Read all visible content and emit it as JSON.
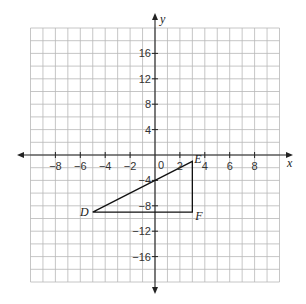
{
  "chart_data": {
    "type": "scatter",
    "title": "",
    "xlabel": "x",
    "ylabel": "y",
    "xlim": [
      -10,
      10
    ],
    "ylim": [
      -20,
      20
    ],
    "grid": true,
    "x_grid_step": 1,
    "y_grid_step": 2,
    "x_ticks": [
      -8,
      -6,
      -4,
      -2,
      2,
      4,
      6,
      8
    ],
    "y_ticks": [
      -16,
      -12,
      -8,
      -4,
      4,
      8,
      12,
      16
    ],
    "origin_label": "0",
    "shapes": [
      {
        "type": "polygon",
        "name": "triangle DEF",
        "points": [
          {
            "label": "D",
            "x": -5,
            "y": -9
          },
          {
            "label": "E",
            "x": 3,
            "y": -1
          },
          {
            "label": "F",
            "x": 3,
            "y": -9
          }
        ]
      }
    ]
  },
  "labels": {
    "x_axis": "x",
    "y_axis": "y",
    "origin": "0",
    "D": "D",
    "E": "E",
    "F": "F"
  }
}
